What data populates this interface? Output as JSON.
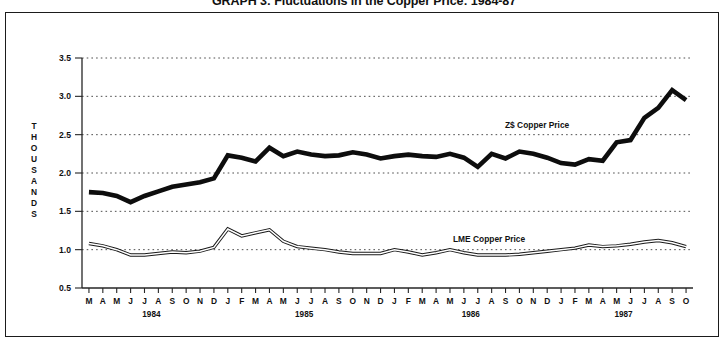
{
  "title": "GRAPH 3: Fluctuations in the Copper Price: 1984-87",
  "axis": {
    "y_axis_name_letters": [
      "T",
      "H",
      "O",
      "U",
      "S",
      "A",
      "N",
      "D",
      "S"
    ],
    "y_axis_name": "THOUSANDS",
    "y_ticks": [
      "3.5",
      "3.0",
      "2.5",
      "2.0",
      "1.5",
      "1.0",
      "0.5"
    ],
    "x_years": [
      "1984",
      "1985",
      "1986",
      "1987"
    ]
  },
  "annotations": {
    "zs_label": "Z$ Copper Price",
    "lme_label": "LME Copper Price"
  },
  "colors": {
    "zs_series": "#0d0d0d",
    "lme_series": "#1a1a1a",
    "frame": "#1b1b1b",
    "grid": "#3a3a3a",
    "background": "#ffffff"
  },
  "chart_data": {
    "type": "line",
    "title": "GRAPH 3: Fluctuations in the Copper Price: 1984-87",
    "xlabel": "",
    "ylabel": "THOUSANDS",
    "ylim": [
      0.5,
      3.5
    ],
    "yticks": [
      0.5,
      1.0,
      1.5,
      2.0,
      2.5,
      3.0,
      3.5
    ],
    "grid": true,
    "legend_position": "inline-annotation",
    "x": [
      "M 1984",
      "A 1984",
      "M 1984",
      "J 1984",
      "J 1984",
      "A 1984",
      "S 1984",
      "O 1984",
      "N 1984",
      "D 1984",
      "J 1985",
      "F 1985",
      "M 1985",
      "A 1985",
      "M 1985",
      "J 1985",
      "J 1985",
      "A 1985",
      "S 1985",
      "O 1985",
      "N 1985",
      "D 1985",
      "J 1986",
      "F 1986",
      "M 1986",
      "A 1986",
      "M 1986",
      "J 1986",
      "J 1986",
      "A 1986",
      "S 1986",
      "O 1986",
      "N 1986",
      "D 1986",
      "J 1987",
      "F 1987",
      "M 1987",
      "A 1987",
      "M 1987",
      "J 1987",
      "J 1987",
      "A 1987",
      "S 1987",
      "O 1987"
    ],
    "x_tick_labels": [
      "M",
      "A",
      "M",
      "J",
      "J",
      "A",
      "S",
      "O",
      "N",
      "D",
      "J",
      "F",
      "M",
      "A",
      "M",
      "J",
      "J",
      "A",
      "S",
      "O",
      "N",
      "D",
      "J",
      "F",
      "M",
      "A",
      "M",
      "J",
      "J",
      "A",
      "S",
      "O",
      "N",
      "D",
      "J",
      "F",
      "M",
      "A",
      "M",
      "J",
      "J",
      "A",
      "S",
      "O"
    ],
    "year_group_labels": [
      {
        "label": "1984",
        "start_index": 0,
        "end_index": 9
      },
      {
        "label": "1985",
        "start_index": 10,
        "end_index": 21
      },
      {
        "label": "1986",
        "start_index": 22,
        "end_index": 33
      },
      {
        "label": "1987",
        "start_index": 34,
        "end_index": 43
      }
    ],
    "series": [
      {
        "name": "Z$ Copper Price",
        "values": [
          1.75,
          1.74,
          1.7,
          1.62,
          1.7,
          1.76,
          1.82,
          1.85,
          1.88,
          1.93,
          2.23,
          2.2,
          2.15,
          2.33,
          2.22,
          2.28,
          2.24,
          2.22,
          2.23,
          2.27,
          2.24,
          2.19,
          2.22,
          2.24,
          2.22,
          2.21,
          2.25,
          2.2,
          2.08,
          2.25,
          2.19,
          2.28,
          2.25,
          2.2,
          2.13,
          2.11,
          2.18,
          2.16,
          2.4,
          2.43,
          2.72,
          2.85,
          3.08,
          2.95
        ]
      },
      {
        "name": "LME Copper Price",
        "values": [
          1.08,
          1.05,
          1.0,
          0.93,
          0.93,
          0.95,
          0.97,
          0.96,
          0.98,
          1.03,
          1.27,
          1.18,
          1.22,
          1.26,
          1.11,
          1.04,
          1.02,
          1.0,
          0.97,
          0.95,
          0.95,
          0.95,
          1.0,
          0.97,
          0.93,
          0.96,
          1.0,
          0.96,
          0.93,
          0.93,
          0.93,
          0.94,
          0.96,
          0.98,
          1.0,
          1.02,
          1.06,
          1.04,
          1.05,
          1.07,
          1.1,
          1.12,
          1.09,
          1.04
        ]
      }
    ]
  }
}
